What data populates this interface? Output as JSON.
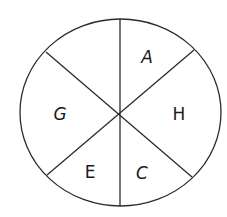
{
  "diagram": {
    "type": "divided-circle",
    "sectors": [
      {
        "id": "top-left",
        "label": ""
      },
      {
        "id": "top-right",
        "label": "A"
      },
      {
        "id": "right",
        "label": "H"
      },
      {
        "id": "bottom-right",
        "label": "C"
      },
      {
        "id": "bottom-left",
        "label": "E"
      },
      {
        "id": "left",
        "label": "G"
      }
    ],
    "colors": {
      "stroke": "#2b2b2b",
      "fill": "#ffffff",
      "text": "#1a1a1a"
    }
  }
}
